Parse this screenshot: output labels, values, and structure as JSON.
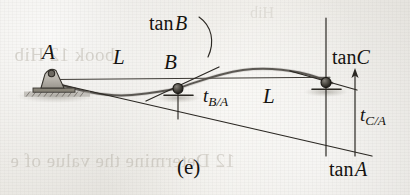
{
  "figure": {
    "caption": "(e)",
    "type": "engineering-beam-deflection-diagram",
    "background_color": "#e9e7e2",
    "ink_color": "#15130f"
  },
  "labels": {
    "point_a": "A",
    "point_b": "B",
    "span_1": "L",
    "span_2": "L",
    "tangent_b": "tan B",
    "tangent_c": "tan C",
    "tangent_a": "tan A",
    "deviation_b_over_a_base": "t",
    "deviation_b_over_a_sub": "B/A",
    "deviation_c_over_a_base": "t",
    "deviation_c_over_a_sub": "C/A"
  },
  "supports": {
    "a": {
      "kind": "pin-support",
      "x": 52,
      "y": 85
    },
    "b": {
      "kind": "roller-support",
      "x": 178,
      "y": 89
    },
    "c": {
      "kind": "roller-support",
      "x": 326,
      "y": 83
    }
  },
  "geometry": {
    "reference_line_y": 79,
    "tangent_a_start": {
      "x": 54,
      "y": 83
    },
    "tangent_a_end": {
      "x": 372,
      "y": 155
    },
    "vertical_b": {
      "x": 178,
      "y_top": 89,
      "y_bottom": 119
    },
    "vertical_c": {
      "x": 326,
      "y_top": 18,
      "y_bottom": 156
    },
    "arrow_c": {
      "x": 355,
      "y_from": 156,
      "y_to": 71
    }
  },
  "ghost_text": {
    "top": "book 12 Hib",
    "bottom": "12 Determine the value of e",
    "faint": "Hib"
  }
}
